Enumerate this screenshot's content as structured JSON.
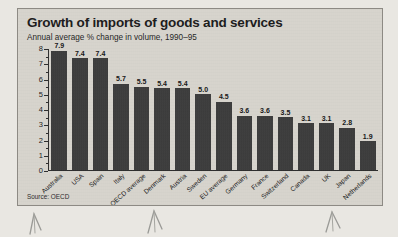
{
  "panel": {
    "title": "Growth of imports of goods and services",
    "subtitle": "Annual average % change in volume, 1990–95",
    "source": "Source: OECD"
  },
  "colors": {
    "bar": "#3b3b3b",
    "panel_background": "#d6d3cc",
    "page_background": "#e9e7e2",
    "axis": "#2b2b2b",
    "text": "#1a1a1a"
  },
  "chart_data": {
    "type": "bar",
    "title": "Growth of imports of goods and services",
    "subtitle": "Annual average % change in volume, 1990–95",
    "xlabel": "",
    "ylabel": "",
    "ylim": [
      0,
      8
    ],
    "yticks": [
      0,
      1,
      2,
      3,
      4,
      5,
      6,
      7,
      8
    ],
    "ytick_labels": [
      "0",
      "1",
      "2",
      "3",
      "4",
      "5",
      "6",
      "7",
      "8"
    ],
    "minor_ticks": true,
    "grid": false,
    "legend": false,
    "source": "Source: OECD",
    "categories": [
      "Australia",
      "USA",
      "Spain",
      "Italy",
      "OECD average",
      "Denmark",
      "Austria",
      "Sweden",
      "EU average",
      "Germany",
      "France",
      "Switzerland",
      "Canada",
      "UK",
      "Japan",
      "Netherlands"
    ],
    "values": [
      7.9,
      7.4,
      7.4,
      5.7,
      5.5,
      5.4,
      5.4,
      5.0,
      4.5,
      3.6,
      3.6,
      3.5,
      3.1,
      3.1,
      2.8,
      1.9
    ],
    "value_labels": [
      "7.9",
      "7.4",
      "7.4",
      "5.7",
      "5.5",
      "5.4",
      "5.4",
      "5.0",
      "4.5",
      "3.6",
      "3.6",
      "3.5",
      "3.1",
      "3.1",
      "2.8",
      "1.9"
    ]
  }
}
